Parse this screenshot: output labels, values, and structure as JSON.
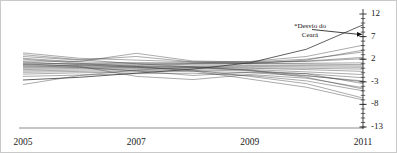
{
  "chart_data": {
    "type": "line",
    "title": "",
    "subtitle": "",
    "xlabel": "",
    "ylabel": "",
    "xlim": [
      2005,
      2011
    ],
    "ylim": [
      -13,
      12
    ],
    "x": [
      2005,
      2006,
      2007,
      2008,
      2009,
      2010,
      2011
    ],
    "xtick_labels": [
      "2005",
      "2007",
      "2009",
      "2011"
    ],
    "xtick_values": [
      2005,
      2007,
      2009,
      2011
    ],
    "ytick_labels": [
      "12",
      "7",
      "2",
      "-3",
      "-8",
      "-13"
    ],
    "ytick_values": [
      12,
      7,
      2,
      -3,
      -8,
      -13
    ],
    "minor_ticks": true,
    "grid": false,
    "legend": "none",
    "line_color": "#3a3a3a",
    "axis_color": "#6f6f6f",
    "border_color": "#c9c9c9",
    "background": "#ffffff",
    "annotations": [
      {
        "text": "*Desvio do\nCeará",
        "target_x": 2011,
        "target_y": 7.5,
        "arrow": "right"
      }
    ],
    "series": [
      {
        "name": "Ceará",
        "highlight": true,
        "values": [
          -2.6,
          -2.0,
          -1.1,
          -0.2,
          1.2,
          4.2,
          9.6
        ]
      },
      {
        "name": "serie-02",
        "highlight": false,
        "values": [
          3.4,
          2.2,
          1.8,
          1.4,
          1.5,
          2.6,
          5.1
        ]
      },
      {
        "name": "serie-03",
        "highlight": false,
        "values": [
          2.6,
          1.8,
          2.6,
          1.4,
          1.0,
          1.8,
          4.0
        ]
      },
      {
        "name": "serie-04",
        "highlight": false,
        "values": [
          1.6,
          1.5,
          3.3,
          1.6,
          1.4,
          2.0,
          3.6
        ]
      },
      {
        "name": "serie-05",
        "highlight": false,
        "values": [
          2.2,
          1.4,
          1.2,
          1.1,
          1.2,
          1.6,
          2.4
        ]
      },
      {
        "name": "serie-06",
        "highlight": false,
        "values": [
          0.9,
          1.0,
          1.1,
          1.2,
          1.3,
          1.5,
          2.1
        ]
      },
      {
        "name": "serie-07",
        "highlight": false,
        "values": [
          1.2,
          0.9,
          0.6,
          0.9,
          1.0,
          1.1,
          1.2
        ]
      },
      {
        "name": "serie-08",
        "highlight": false,
        "values": [
          0.4,
          0.6,
          0.8,
          1.0,
          1.0,
          0.9,
          0.8
        ]
      },
      {
        "name": "serie-09",
        "highlight": false,
        "values": [
          0.8,
          0.5,
          0.4,
          0.5,
          0.6,
          0.6,
          0.5
        ]
      },
      {
        "name": "serie-10",
        "highlight": false,
        "values": [
          0.2,
          0.3,
          0.3,
          0.4,
          0.4,
          0.3,
          0.2
        ]
      },
      {
        "name": "serie-11",
        "highlight": false,
        "values": [
          0.0,
          0.1,
          0.2,
          0.2,
          0.1,
          0.0,
          -0.2
        ]
      },
      {
        "name": "serie-12",
        "highlight": false,
        "values": [
          -0.3,
          -0.1,
          0.0,
          0.1,
          0.0,
          -0.3,
          -0.7
        ]
      },
      {
        "name": "serie-13",
        "highlight": false,
        "values": [
          -0.6,
          -0.4,
          -0.2,
          -0.1,
          -0.3,
          -0.8,
          -1.4
        ]
      },
      {
        "name": "serie-14",
        "highlight": false,
        "values": [
          -0.9,
          -0.7,
          -0.5,
          -0.4,
          -0.6,
          -1.2,
          -2.1
        ]
      },
      {
        "name": "serie-15",
        "highlight": false,
        "values": [
          -1.3,
          -1.0,
          -0.8,
          -0.7,
          -1.0,
          -1.7,
          -2.8
        ]
      },
      {
        "name": "serie-16",
        "highlight": false,
        "values": [
          0.6,
          0.2,
          -0.6,
          -1.6,
          -0.9,
          -1.2,
          -3.4
        ]
      },
      {
        "name": "serie-17",
        "highlight": false,
        "values": [
          1.0,
          0.4,
          -1.8,
          -2.5,
          -1.4,
          -2.2,
          -4.3
        ]
      },
      {
        "name": "serie-18",
        "highlight": false,
        "values": [
          -1.8,
          -1.5,
          -1.2,
          -1.1,
          -1.6,
          -2.8,
          -5.0
        ]
      },
      {
        "name": "serie-19",
        "highlight": false,
        "values": [
          1.4,
          0.8,
          0.2,
          -0.4,
          -1.8,
          -3.4,
          -6.6
        ]
      },
      {
        "name": "serie-20",
        "highlight": false,
        "values": [
          2.0,
          1.1,
          0.4,
          -0.6,
          -2.4,
          -4.2,
          -7.0
        ]
      },
      {
        "name": "serie-21",
        "highlight": false,
        "values": [
          -3.6,
          -1.6,
          -0.4,
          0.2,
          -0.5,
          -2.0,
          -4.6
        ]
      },
      {
        "name": "serie-22",
        "highlight": false,
        "values": [
          3.0,
          1.9,
          1.0,
          0.3,
          -0.4,
          -1.6,
          -3.0
        ]
      }
    ]
  },
  "figure": {
    "annotation_text": "*Desvio do\nCeará"
  }
}
